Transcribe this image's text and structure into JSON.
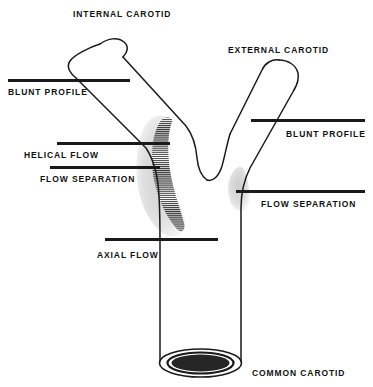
{
  "figure": {
    "background_color": "#ffffff",
    "ink_color": "#1a1a1a"
  },
  "vessel_labels": {
    "internal_carotid": "INTERNAL CAROTID",
    "external_carotid": "EXTERNAL CAROTID",
    "common_carotid": "COMMON CAROTID"
  },
  "flow_callouts": {
    "blunt_profile_internal": "BLUNT PROFILE",
    "helical_flow": "HELICAL FLOW",
    "flow_separation_internal": "FLOW SEPARATION",
    "axial_flow": "AXIAL FLOW",
    "blunt_profile_external": "BLUNT PROFILE",
    "flow_separation_external": "FLOW SEPARATION"
  },
  "regions": {
    "helical_flow_hatch": "hatched-crescent-internal-carotid-bulb",
    "flow_separation_shading_internal": "gray-shading-internal-carotid-bulb",
    "flow_separation_shading_external": "gray-shading-external-carotid-origin",
    "lumen_disc": "black-ellipse-common-carotid-lumen"
  }
}
